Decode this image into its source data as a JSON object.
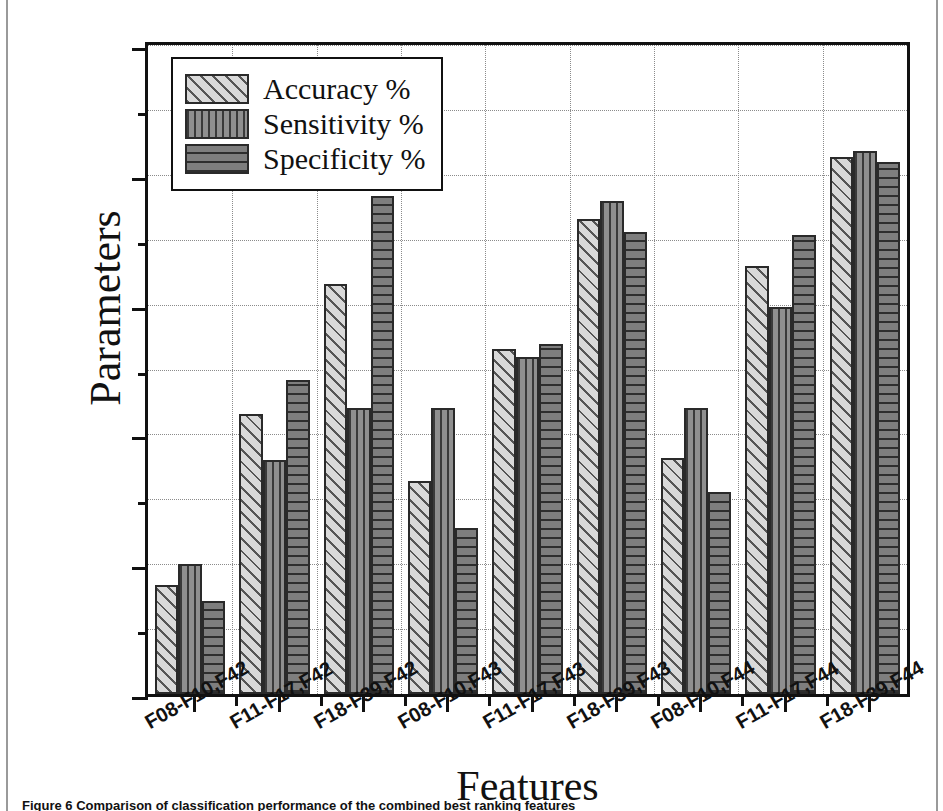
{
  "figure": {
    "caption": "Figure 6 Comparison of classification performance of the combined best ranking features"
  },
  "chart_data": {
    "type": "bar",
    "title": "",
    "xlabel": "Features",
    "ylabel": "Parameters",
    "ylim": [
      75,
      100
    ],
    "ytick_step": 5,
    "yminor_step": 2.5,
    "grid": "dotted-both",
    "legend_position": "top-left",
    "yticks": [
      "75",
      "80",
      "85",
      "90",
      "95",
      "100"
    ],
    "categories": [
      "F08-F10,F42",
      "F11-F17,F42",
      "F18-F39,F42",
      "F08-F10,F43",
      "F11-F17,F43",
      "F18-F39,F43",
      "F08-F10,F44",
      "F11-F17,F44",
      "F18-F39,F44"
    ],
    "series": [
      {
        "name": "Accuracy %",
        "pattern": "diagonal-hatch",
        "color": "#d9d9d9",
        "values": [
          79.2,
          85.8,
          90.8,
          83.2,
          88.3,
          93.3,
          84.1,
          91.5,
          95.7
        ]
      },
      {
        "name": "Sensitivity %",
        "pattern": "vertical-stripe",
        "color": "#8f8f8f",
        "values": [
          80.0,
          84.0,
          86.0,
          86.0,
          88.0,
          94.0,
          86.0,
          89.9,
          95.9
        ]
      },
      {
        "name": "Specificity %",
        "pattern": "horizontal-stripe",
        "color": "#7e7e7e",
        "values": [
          78.6,
          87.1,
          94.2,
          81.4,
          88.5,
          92.8,
          82.8,
          92.7,
          95.5
        ]
      }
    ]
  }
}
